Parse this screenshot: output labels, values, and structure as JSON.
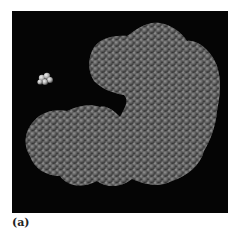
{
  "figure": {
    "panel_label": "(a)",
    "colors": {
      "background": "#050505",
      "atoms": "#6e6e6e",
      "atom_highlight": "#a8a8a8",
      "ligand": "#d8d8d8"
    }
  }
}
